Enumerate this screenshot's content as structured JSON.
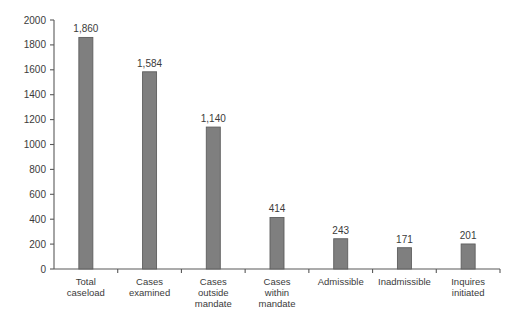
{
  "chart_data": {
    "type": "bar",
    "title": "",
    "xlabel": "",
    "ylabel": "",
    "ylim": [
      0,
      2000
    ],
    "grid": false,
    "legend": false,
    "y_ticks": [
      0,
      200,
      400,
      600,
      800,
      1000,
      1200,
      1400,
      1600,
      1800,
      2000
    ],
    "y_tick_labels": [
      "0",
      "200",
      "400",
      "600",
      "800",
      "1000",
      "1200",
      "1400",
      "1600",
      "1800",
      "2000"
    ],
    "categories": [
      "Total caseload",
      "Cases examined",
      "Cases outside mandate",
      "Cases within mandate",
      "Admissible",
      "Inadmissible",
      "Inquires initiated"
    ],
    "category_lines": [
      [
        "Total",
        "caseload"
      ],
      [
        "Cases",
        "examined"
      ],
      [
        "Cases",
        "outside",
        "mandate"
      ],
      [
        "Cases",
        "within",
        "mandate"
      ],
      [
        "Admissible"
      ],
      [
        "Inadmissible"
      ],
      [
        "Inquires",
        "initiated"
      ]
    ],
    "values": [
      1860,
      1584,
      1140,
      414,
      243,
      171,
      201
    ],
    "value_labels": [
      "1,860",
      "1,584",
      "1,140",
      "414",
      "243",
      "171",
      "201"
    ],
    "colors": {
      "bar_fill": "#7f7f7f",
      "bar_stroke": "#5e5e5e",
      "axis": "#595959",
      "text": "#3b3b3b",
      "background": "#ffffff"
    }
  }
}
